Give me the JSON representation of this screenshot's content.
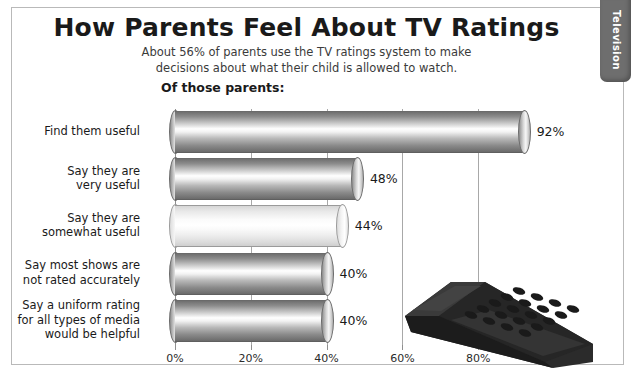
{
  "side_tab": {
    "label": "Television"
  },
  "header": {
    "title": "How Parents Feel About TV Ratings",
    "subtitle_line1": "About 56% of parents use the TV ratings system to make",
    "subtitle_line2": "decisions about what their child is allowed to watch.",
    "section_label": "Of those parents:"
  },
  "decoration": {
    "remote_icon": "tv-remote-illustration"
  },
  "chart_data": {
    "type": "bar",
    "orientation": "horizontal",
    "title": "How Parents Feel About TV Ratings",
    "subtitle": "About 56% of parents use the TV ratings system to make decisions about what their child is allowed to watch.",
    "xlabel": "",
    "ylabel": "",
    "xlim": [
      0,
      100
    ],
    "grid": true,
    "legend": false,
    "tick_labels": [
      "0%",
      "20%",
      "40%",
      "60%",
      "80%"
    ],
    "tick_values": [
      0,
      20,
      40,
      60,
      80
    ],
    "categories": [
      "Find them useful",
      "Say they are very useful",
      "Say they are somewhat useful",
      "Say most shows are not rated accurately",
      "Say a uniform rating for all types of media would be helpful"
    ],
    "category_lines": [
      [
        "Find them useful"
      ],
      [
        "Say they are",
        "very useful"
      ],
      [
        "Say they are",
        "somewhat useful"
      ],
      [
        "Say most shows are",
        "not rated accurately"
      ],
      [
        "Say a uniform rating",
        "for all types of media",
        "would be helpful"
      ]
    ],
    "values": [
      92,
      48,
      44,
      40,
      40
    ],
    "value_labels": [
      "92%",
      "48%",
      "44%",
      "40%",
      "40%"
    ],
    "bar_styles": [
      "dark",
      "dark",
      "light",
      "dark",
      "dark"
    ]
  }
}
